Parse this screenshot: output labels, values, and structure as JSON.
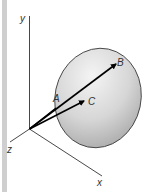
{
  "diagram": {
    "type": "3d-vector-diagram",
    "axes": {
      "y_label": "y",
      "x_label": "x",
      "z_label": "z"
    },
    "points": {
      "a_label": "A",
      "b_label": "B",
      "c_label": "C"
    },
    "colors": {
      "surface_fill_light": "#f2f2f2",
      "surface_fill_dark": "#a9a9a9",
      "surface_stroke": "#444444",
      "axis": "#333333",
      "vector": "#000000",
      "side_strip": "#cfcfcf"
    }
  }
}
